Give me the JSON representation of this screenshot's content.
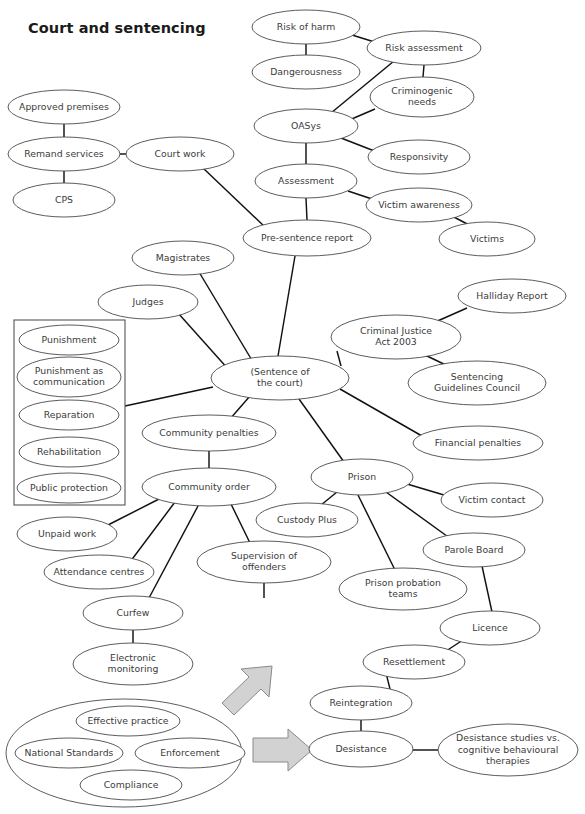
{
  "page": {
    "title": "Court and sentencing",
    "width": 585,
    "height": 814,
    "background": "#ffffff",
    "node_stroke": "#4a4a4a",
    "edge_stroke": "#111111",
    "text_color": "#3b3b3b",
    "arrow_fill": "#d2d2d2",
    "arrow_stroke": "#8a8a8a"
  },
  "chart_data": {
    "type": "diagram",
    "subtype": "concept-map",
    "title": "Court and sentencing",
    "node_count": 41,
    "edge_count": 36
  },
  "nodes": [
    {
      "id": "risk_of_harm",
      "label": "Risk of harm",
      "lines": [
        "Risk of harm"
      ],
      "cx": 306,
      "cy": 27,
      "rx": 54,
      "ry": 17
    },
    {
      "id": "risk_assessment",
      "label": "Risk assessment",
      "lines": [
        "Risk assessment"
      ],
      "cx": 424,
      "cy": 48,
      "rx": 57,
      "ry": 17
    },
    {
      "id": "dangerousness",
      "label": "Dangerousness",
      "lines": [
        "Dangerousness"
      ],
      "cx": 306,
      "cy": 72,
      "rx": 54,
      "ry": 17
    },
    {
      "id": "criminogenic_needs",
      "label": "Criminogenic needs",
      "lines": [
        "Criminogenic",
        "needs"
      ],
      "cx": 422,
      "cy": 97,
      "rx": 52,
      "ry": 20
    },
    {
      "id": "oasys",
      "label": "OASys",
      "lines": [
        "OASys"
      ],
      "cx": 306,
      "cy": 126,
      "rx": 52,
      "ry": 17
    },
    {
      "id": "responsivity",
      "label": "Responsivity",
      "lines": [
        "Responsivity"
      ],
      "cx": 419,
      "cy": 157,
      "rx": 51,
      "ry": 17
    },
    {
      "id": "assessment",
      "label": "Assessment",
      "lines": [
        "Assessment"
      ],
      "cx": 306,
      "cy": 181,
      "rx": 51,
      "ry": 17
    },
    {
      "id": "victim_awareness",
      "label": "Victim awareness",
      "lines": [
        "Victim awareness"
      ],
      "cx": 419,
      "cy": 205,
      "rx": 53,
      "ry": 17
    },
    {
      "id": "victims",
      "label": "Victims",
      "lines": [
        "Victims"
      ],
      "cx": 487,
      "cy": 239,
      "rx": 48,
      "ry": 17
    },
    {
      "id": "pre_sentence_report",
      "label": "Pre-sentence report",
      "lines": [
        "Pre-sentence report"
      ],
      "cx": 307,
      "cy": 238,
      "rx": 64,
      "ry": 18
    },
    {
      "id": "approved_premises",
      "label": "Approved premises",
      "lines": [
        "Approved premises"
      ],
      "cx": 64,
      "cy": 107,
      "rx": 56,
      "ry": 17
    },
    {
      "id": "remand_services",
      "label": "Remand services",
      "lines": [
        "Remand services"
      ],
      "cx": 64,
      "cy": 154,
      "rx": 56,
      "ry": 17
    },
    {
      "id": "cps",
      "label": "CPS",
      "lines": [
        "CPS"
      ],
      "cx": 64,
      "cy": 200,
      "rx": 51,
      "ry": 17
    },
    {
      "id": "court_work",
      "label": "Court work",
      "lines": [
        "Court work"
      ],
      "cx": 180,
      "cy": 154,
      "rx": 54,
      "ry": 17
    },
    {
      "id": "magistrates",
      "label": "Magistrates",
      "lines": [
        "Magistrates"
      ],
      "cx": 183,
      "cy": 258,
      "rx": 51,
      "ry": 17
    },
    {
      "id": "judges",
      "label": "Judges",
      "lines": [
        "Judges"
      ],
      "cx": 148,
      "cy": 302,
      "rx": 50,
      "ry": 17
    },
    {
      "id": "sentence_of_court",
      "label": "(Sentence of the court)",
      "lines": [
        "(Sentence of",
        "the court)"
      ],
      "cx": 280,
      "cy": 378,
      "rx": 69,
      "ry": 22
    },
    {
      "id": "halliday_report",
      "label": "Halliday Report",
      "lines": [
        "Halliday Report"
      ],
      "cx": 512,
      "cy": 296,
      "rx": 54,
      "ry": 17
    },
    {
      "id": "criminal_justice_act",
      "label": "Criminal Justice Act 2003",
      "lines": [
        "Criminal Justice",
        "Act 2003"
      ],
      "cx": 396,
      "cy": 337,
      "rx": 65,
      "ry": 22
    },
    {
      "id": "sentencing_guidelines",
      "label": "Sentencing Guidelines Council",
      "lines": [
        "Sentencing",
        "Guidelines Council"
      ],
      "cx": 477,
      "cy": 383,
      "rx": 69,
      "ry": 22
    },
    {
      "id": "financial_penalties",
      "label": "Financial penalties",
      "lines": [
        "Financial penalties"
      ],
      "cx": 478,
      "cy": 443,
      "rx": 65,
      "ry": 17
    },
    {
      "id": "community_penalties",
      "label": "Community penalties",
      "lines": [
        "Community penalties"
      ],
      "cx": 209,
      "cy": 433,
      "rx": 67,
      "ry": 18
    },
    {
      "id": "community_order",
      "label": "Community order",
      "lines": [
        "Community order"
      ],
      "cx": 209,
      "cy": 487,
      "rx": 67,
      "ry": 19
    },
    {
      "id": "prison",
      "label": "Prison",
      "lines": [
        "Prison"
      ],
      "cx": 362,
      "cy": 477,
      "rx": 51,
      "ry": 18
    },
    {
      "id": "victim_contact",
      "label": "Victim contact",
      "lines": [
        "Victim contact"
      ],
      "cx": 492,
      "cy": 500,
      "rx": 51,
      "ry": 17
    },
    {
      "id": "custody_plus",
      "label": "Custody Plus",
      "lines": [
        "Custody Plus"
      ],
      "cx": 307,
      "cy": 520,
      "rx": 51,
      "ry": 17
    },
    {
      "id": "parole_board",
      "label": "Parole Board",
      "lines": [
        "Parole Board"
      ],
      "cx": 474,
      "cy": 550,
      "rx": 51,
      "ry": 17
    },
    {
      "id": "unpaid_work",
      "label": "Unpaid work",
      "lines": [
        "Unpaid work"
      ],
      "cx": 67,
      "cy": 534,
      "rx": 50,
      "ry": 17
    },
    {
      "id": "attendance_centres",
      "label": "Attendance centres",
      "lines": [
        "Attendance centres"
      ],
      "cx": 99,
      "cy": 572,
      "rx": 55,
      "ry": 17
    },
    {
      "id": "supervision",
      "label": "Supervision of offenders",
      "lines": [
        "Supervision of",
        "offenders"
      ],
      "cx": 264,
      "cy": 562,
      "rx": 67,
      "ry": 21
    },
    {
      "id": "prison_probation",
      "label": "Prison probation teams",
      "lines": [
        "Prison probation",
        "teams"
      ],
      "cx": 403,
      "cy": 589,
      "rx": 64,
      "ry": 21
    },
    {
      "id": "curfew",
      "label": "Curfew",
      "lines": [
        "Curfew"
      ],
      "cx": 133,
      "cy": 613,
      "rx": 50,
      "ry": 17
    },
    {
      "id": "licence",
      "label": "Licence",
      "lines": [
        "Licence"
      ],
      "cx": 490,
      "cy": 628,
      "rx": 50,
      "ry": 17
    },
    {
      "id": "electronic_monitoring",
      "label": "Electronic monitoring",
      "lines": [
        "Electronic",
        "monitoring"
      ],
      "cx": 133,
      "cy": 664,
      "rx": 60,
      "ry": 21
    },
    {
      "id": "resettlement",
      "label": "Resettlement",
      "lines": [
        "Resettlement"
      ],
      "cx": 414,
      "cy": 662,
      "rx": 51,
      "ry": 17
    },
    {
      "id": "reintegration",
      "label": "Reintegration",
      "lines": [
        "Reintegration"
      ],
      "cx": 361,
      "cy": 703,
      "rx": 51,
      "ry": 17
    },
    {
      "id": "desistance",
      "label": "Desistance",
      "lines": [
        "Desistance"
      ],
      "cx": 361,
      "cy": 749,
      "rx": 52,
      "ry": 18
    },
    {
      "id": "desistance_studies",
      "label": "Desistance studies vs. cognitive behavioural therapies",
      "lines": [
        "Desistance studies vs.",
        "cognitive behavioural",
        "therapies"
      ],
      "cx": 508,
      "cy": 750,
      "rx": 70,
      "ry": 26
    },
    {
      "id": "effective_practice",
      "label": "Effective practice",
      "lines": [
        "Effective practice"
      ],
      "cx": 128,
      "cy": 721,
      "rx": 52,
      "ry": 15
    },
    {
      "id": "national_standards",
      "label": "National Standards",
      "lines": [
        "National Standards"
      ],
      "cx": 69,
      "cy": 753,
      "rx": 54,
      "ry": 15
    },
    {
      "id": "enforcement",
      "label": "Enforcement",
      "lines": [
        "Enforcement"
      ],
      "cx": 190,
      "cy": 753,
      "rx": 55,
      "ry": 15
    },
    {
      "id": "compliance",
      "label": "Compliance",
      "lines": [
        "Compliance"
      ],
      "cx": 131,
      "cy": 785,
      "rx": 51,
      "ry": 15
    }
  ],
  "group_ellipse": {
    "id": "effective_practice_group",
    "label": "Effective practice grouping",
    "cx": 124,
    "cy": 753,
    "rx": 118,
    "ry": 54
  },
  "panel": {
    "id": "sentencing_aims_panel",
    "label": "Sentencing aims panel",
    "x": 14,
    "y": 320,
    "width": 111,
    "height": 185,
    "items": [
      {
        "id": "punishment",
        "label": "Punishment",
        "lines": [
          "Punishment"
        ],
        "cx": 69,
        "cy": 340,
        "rx": 50,
        "ry": 15
      },
      {
        "id": "punishment_comm",
        "label": "Punishment as communication",
        "lines": [
          "Punishment as",
          "communication"
        ],
        "cx": 69,
        "cy": 377,
        "rx": 52,
        "ry": 20
      },
      {
        "id": "reparation",
        "label": "Reparation",
        "lines": [
          "Reparation"
        ],
        "cx": 69,
        "cy": 415,
        "rx": 50,
        "ry": 15
      },
      {
        "id": "rehabilitation",
        "label": "Rehabilitation",
        "lines": [
          "Rehabilitation"
        ],
        "cx": 69,
        "cy": 452,
        "rx": 50,
        "ry": 15
      },
      {
        "id": "public_protection",
        "label": "Public protection",
        "lines": [
          "Public protection"
        ],
        "cx": 69,
        "cy": 488,
        "rx": 52,
        "ry": 15
      }
    ]
  },
  "edges": [
    {
      "from": "risk_of_harm",
      "to": "dangerousness",
      "x1": 306,
      "y1": 44,
      "x2": 306,
      "y2": 55
    },
    {
      "from": "risk_of_harm",
      "to": "risk_assessment",
      "x1": 352,
      "y1": 35,
      "x2": 381,
      "y2": 44
    },
    {
      "from": "risk_assessment",
      "to": "criminogenic_needs",
      "x1": 424,
      "y1": 65,
      "x2": 423,
      "y2": 77
    },
    {
      "from": "risk_assessment",
      "to": "oasys",
      "x1": 394,
      "y1": 61,
      "x2": 331,
      "y2": 113
    },
    {
      "from": "criminogenic_needs",
      "to": "oasys",
      "x1": 375,
      "y1": 109,
      "x2": 347,
      "y2": 121
    },
    {
      "from": "oasys",
      "to": "responsivity",
      "x1": 341,
      "y1": 138,
      "x2": 377,
      "y2": 152
    },
    {
      "from": "oasys",
      "to": "assessment",
      "x1": 306,
      "y1": 143,
      "x2": 306,
      "y2": 164
    },
    {
      "from": "assessment",
      "to": "victim_awareness",
      "x1": 348,
      "y1": 191,
      "x2": 375,
      "y2": 200
    },
    {
      "from": "victim_awareness",
      "to": "victims",
      "x1": 452,
      "y1": 216,
      "x2": 471,
      "y2": 226
    },
    {
      "from": "assessment",
      "to": "pre_sentence_report",
      "x1": 306,
      "y1": 198,
      "x2": 307,
      "y2": 220
    },
    {
      "from": "approved_premises",
      "to": "remand_services",
      "x1": 64,
      "y1": 124,
      "x2": 64,
      "y2": 137
    },
    {
      "from": "remand_services",
      "to": "cps",
      "x1": 64,
      "y1": 171,
      "x2": 64,
      "y2": 183
    },
    {
      "from": "remand_services",
      "to": "court_work",
      "x1": 120,
      "y1": 154,
      "x2": 127,
      "y2": 154
    },
    {
      "from": "court_work",
      "to": "pre_sentence_report",
      "x1": 203,
      "y1": 168,
      "x2": 266,
      "y2": 228
    },
    {
      "from": "pre_sentence_report",
      "to": "sentence_of_court",
      "x1": 295,
      "y1": 256,
      "x2": 278,
      "y2": 356
    },
    {
      "from": "magistrates",
      "to": "sentence_of_court",
      "x1": 199,
      "y1": 272,
      "x2": 253,
      "y2": 362
    },
    {
      "from": "judges",
      "to": "sentence_of_court",
      "x1": 178,
      "y1": 313,
      "x2": 229,
      "y2": 370
    },
    {
      "from": "sentencing_aims_panel",
      "to": "sentence_of_court",
      "x1": 125,
      "y1": 406,
      "x2": 213,
      "y2": 387
    },
    {
      "from": "halliday_report",
      "to": "criminal_justice_act",
      "x1": 467,
      "y1": 308,
      "x2": 433,
      "y2": 323
    },
    {
      "from": "criminal_justice_act",
      "to": "sentence_of_court",
      "x1": 337,
      "y1": 351,
      "x2": 341,
      "y2": 366
    },
    {
      "from": "criminal_justice_act",
      "to": "sentencing_guidelines",
      "x1": 425,
      "y1": 355,
      "x2": 452,
      "y2": 368
    },
    {
      "from": "sentence_of_court",
      "to": "financial_penalties",
      "x1": 340,
      "y1": 389,
      "x2": 422,
      "y2": 436
    },
    {
      "from": "sentence_of_court",
      "to": "community_penalties",
      "x1": 250,
      "y1": 396,
      "x2": 230,
      "y2": 419
    },
    {
      "from": "sentence_of_court",
      "to": "prison",
      "x1": 299,
      "y1": 399,
      "x2": 344,
      "y2": 462
    },
    {
      "from": "community_penalties",
      "to": "community_order",
      "x1": 209,
      "y1": 451,
      "x2": 209,
      "y2": 469
    },
    {
      "from": "community_order",
      "to": "unpaid_work",
      "x1": 163,
      "y1": 497,
      "x2": 108,
      "y2": 525
    },
    {
      "from": "community_order",
      "to": "attendance_centres",
      "x1": 175,
      "y1": 502,
      "x2": 130,
      "y2": 562
    },
    {
      "from": "community_order",
      "to": "curfew",
      "x1": 198,
      "y1": 506,
      "x2": 149,
      "y2": 598
    },
    {
      "from": "community_order",
      "to": "supervision",
      "x1": 231,
      "y1": 504,
      "x2": 250,
      "y2": 543
    },
    {
      "from": "curfew",
      "to": "electronic_monitoring",
      "x1": 133,
      "y1": 630,
      "x2": 133,
      "y2": 645
    },
    {
      "from": "supervision",
      "to": "arrow_up",
      "x1": 264,
      "y1": 583,
      "x2": 264,
      "y2": 598
    },
    {
      "from": "prison",
      "to": "custody_plus",
      "x1": 337,
      "y1": 492,
      "x2": 321,
      "y2": 505
    },
    {
      "from": "prison",
      "to": "victim_contact",
      "x1": 407,
      "y1": 484,
      "x2": 444,
      "y2": 495
    },
    {
      "from": "prison",
      "to": "prison_probation",
      "x1": 358,
      "y1": 495,
      "x2": 395,
      "y2": 570
    },
    {
      "from": "prison",
      "to": "parole_board",
      "x1": 386,
      "y1": 492,
      "x2": 451,
      "y2": 539
    },
    {
      "from": "parole_board",
      "to": "licence",
      "x1": 482,
      "y1": 566,
      "x2": 492,
      "y2": 612
    },
    {
      "from": "licence",
      "to": "resettlement",
      "x1": 463,
      "y1": 640,
      "x2": 443,
      "y2": 653
    },
    {
      "from": "resettlement",
      "to": "reintegration",
      "x1": 386,
      "y1": 673,
      "x2": 391,
      "y2": 693
    },
    {
      "from": "reintegration",
      "to": "desistance",
      "x1": 361,
      "y1": 720,
      "x2": 361,
      "y2": 731
    },
    {
      "from": "desistance",
      "to": "desistance_studies",
      "x1": 413,
      "y1": 750,
      "x2": 439,
      "y2": 750
    }
  ],
  "arrows": [
    {
      "id": "arrow-diagonal-up",
      "label": "diagonal arrow pointing up-right",
      "points": "222,703 249,677 241,669 272,666 269,697 261,689 234,715"
    },
    {
      "id": "arrow-right",
      "label": "arrow pointing right",
      "points": "253,738 288,738 288,729 312,750 288,771 288,762 253,762"
    }
  ]
}
